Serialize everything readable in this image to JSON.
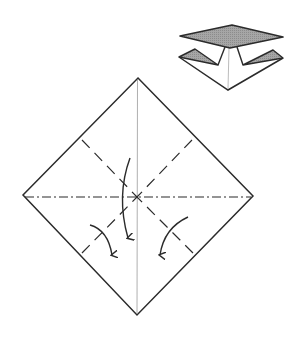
{
  "diagram": {
    "type": "origami-fold-instruction",
    "colors": {
      "background": "#ffffff",
      "line": "#2b2b2b",
      "center_crease": "#9a9a9a",
      "shaded_paper": "#9e9e9e"
    },
    "main_square": {
      "vertices": {
        "top": [
          138,
          78
        ],
        "right": [
          253,
          196
        ],
        "bottom": [
          137,
          315
        ],
        "left": [
          23,
          195
        ]
      },
      "center": [
        137,
        197
      ]
    },
    "fold_lines": {
      "mountain_fold_horizontal": {
        "style": "dash-dot",
        "from": [
          23,
          197
        ],
        "to": [
          253,
          197
        ]
      },
      "valley_folds": [
        {
          "style": "dashed",
          "from": [
            82,
            140
          ],
          "to": [
            137,
            197
          ]
        },
        {
          "style": "dashed",
          "from": [
            192,
            140
          ],
          "to": [
            137,
            197
          ]
        },
        {
          "style": "dashed",
          "from": [
            82,
            253
          ],
          "to": [
            137,
            197
          ]
        },
        {
          "style": "dashed",
          "from": [
            193,
            253
          ],
          "to": [
            137,
            197
          ]
        }
      ],
      "vertical_crease": {
        "style": "thin-solid",
        "from": [
          137,
          80
        ],
        "to": [
          137,
          313
        ]
      }
    },
    "arrows": [
      {
        "name": "center-fold-down-arrow",
        "path": "M130 158 Q116 196 128 238"
      },
      {
        "name": "left-flap-fold-arrow",
        "path": "M90 225 Q108 230 112 255"
      },
      {
        "name": "right-flap-fold-arrow",
        "path": "M188 217 Q164 228 160 255"
      }
    ],
    "result_preview": {
      "label": "folded result preview",
      "top_shaded_diamond": [
        [
          180,
          36
        ],
        [
          232,
          25
        ],
        [
          283,
          37
        ],
        [
          230,
          48
        ]
      ],
      "left_flap_shaded": [
        [
          179,
          57
        ],
        [
          195,
          49
        ],
        [
          218,
          65
        ]
      ],
      "right_flap_shaded": [
        [
          283,
          58
        ],
        [
          273,
          50
        ],
        [
          243,
          65
        ]
      ],
      "bottom_point": [
        228,
        90
      ]
    }
  }
}
